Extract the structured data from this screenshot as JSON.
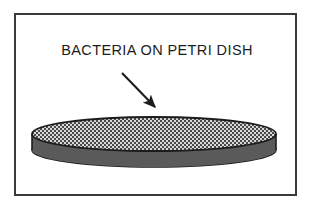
{
  "figure": {
    "caption": "BACTERIA ON PETRI DISH",
    "frame": {
      "border_color": "#3a3a3a",
      "background": "#ffffff",
      "border_width_px": 2
    },
    "annotation_arrow": {
      "name": "pointer-arrow",
      "from_x": 122,
      "from_y": 73,
      "to_x": 157,
      "to_y": 110,
      "color": "#1c1c1c",
      "points_to": "bacteria-lawn"
    },
    "petri_dish": {
      "label": "petri dish",
      "center_x": 154,
      "lid": {
        "label": "bacteria lawn on agar surface",
        "center_y": 134,
        "radius_x": 122,
        "radius_y": 17,
        "fill_pattern": "stipple-checker",
        "fill_light": "#d8d8d8",
        "fill_dark": "#4a4a4a",
        "outline_color": "#1c1c1c"
      },
      "base": {
        "label": "dish base",
        "center_y": 150,
        "radius_x": 122,
        "radius_y": 17,
        "fill": "#5a5a5a",
        "outline_color": "#1c1c1c"
      }
    }
  }
}
